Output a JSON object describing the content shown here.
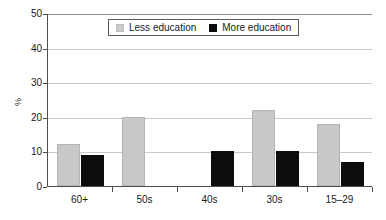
{
  "chart_data": {
    "type": "bar",
    "title": "",
    "xlabel": "",
    "ylabel": "%",
    "ylim": [
      0,
      50
    ],
    "yticks": [
      0,
      10,
      20,
      30,
      40,
      50
    ],
    "ytick_labels": [
      "0",
      "10",
      "20",
      "30",
      "40",
      "50"
    ],
    "grid": true,
    "legend_position": "top-center",
    "categories": [
      "60+",
      "50s",
      "40s",
      "30s",
      "15–29"
    ],
    "series": [
      {
        "name": "Less education",
        "color": "#c8c8c8",
        "values": [
          12,
          20,
          0,
          22,
          18
        ]
      },
      {
        "name": "More education",
        "color": "#0d0d0d",
        "values": [
          9,
          0,
          10,
          10,
          7
        ]
      }
    ]
  },
  "legend": {
    "entries": [
      {
        "label": "Less education",
        "swatch": "less"
      },
      {
        "label": "More education",
        "swatch": "more"
      }
    ]
  },
  "axes": {
    "y_title": "%"
  },
  "colors": {
    "less_education": "#c8c8c8",
    "more_education": "#0d0d0d",
    "gridline": "#c9c9c9",
    "axis": "#4d4d4d",
    "background": "#ffffff"
  }
}
